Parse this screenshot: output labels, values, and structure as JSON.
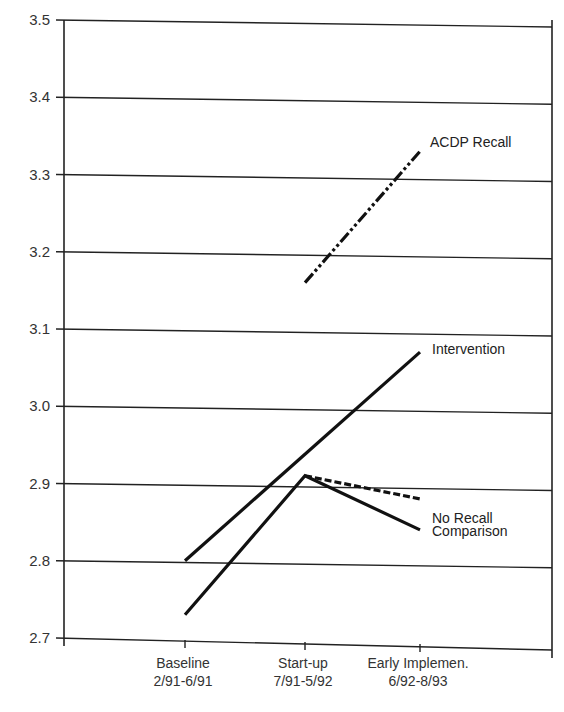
{
  "chart_data": {
    "type": "line",
    "title": "",
    "xlabel": "",
    "ylabel": "",
    "ylim": [
      2.7,
      3.5
    ],
    "yticks": [
      "3.5",
      "3.4",
      "3.3",
      "3.2",
      "3.1",
      "3.0",
      "2.9",
      "2.8",
      "2.7"
    ],
    "grid": true,
    "legend_position": "inline-right",
    "categories": [
      {
        "line1": "Baseline",
        "line2": "2/91-6/91"
      },
      {
        "line1": "Start-up",
        "line2": "7/91-5/92"
      },
      {
        "line1": "Early Implemen.",
        "line2": "6/92-8/93"
      }
    ],
    "series": [
      {
        "name": "ACDP Recall",
        "style": "dash-dot-dot",
        "values": [
          null,
          3.16,
          3.33
        ]
      },
      {
        "name": "Intervention",
        "style": "solid",
        "values": [
          2.8,
          null,
          3.07
        ]
      },
      {
        "name": "No Recall",
        "style": "dashed",
        "values": [
          null,
          2.91,
          2.88
        ]
      },
      {
        "name": "Comparison",
        "style": "solid",
        "values": [
          2.73,
          2.91,
          2.84
        ]
      }
    ]
  }
}
